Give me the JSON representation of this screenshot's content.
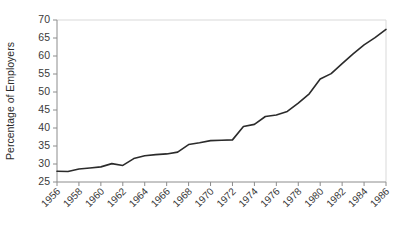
{
  "chart_data": {
    "type": "line",
    "title": "",
    "xlabel": "",
    "ylabel": "Percentage of Employers",
    "xlim": [
      1956,
      1986
    ],
    "ylim": [
      25,
      70
    ],
    "ytick_step": 5,
    "xtick_step": 2,
    "grid": false,
    "legend": "none",
    "yticks": [
      25,
      30,
      35,
      40,
      45,
      50,
      55,
      60,
      65,
      70
    ],
    "xticks": [
      1956,
      1958,
      1960,
      1962,
      1964,
      1966,
      1968,
      1970,
      1972,
      1974,
      1976,
      1978,
      1980,
      1982,
      1984,
      1986
    ],
    "x": [
      1956,
      1957,
      1958,
      1959,
      1960,
      1961,
      1962,
      1963,
      1964,
      1965,
      1966,
      1967,
      1968,
      1969,
      1970,
      1971,
      1972,
      1973,
      1974,
      1975,
      1976,
      1977,
      1978,
      1979,
      1980,
      1981,
      1982,
      1983,
      1984,
      1985,
      1986
    ],
    "values": [
      28.0,
      27.9,
      28.6,
      28.9,
      29.2,
      30.1,
      29.6,
      31.5,
      32.3,
      32.6,
      32.8,
      33.3,
      35.4,
      35.9,
      36.5,
      36.6,
      36.7,
      40.4,
      41.0,
      43.2,
      43.6,
      44.6,
      46.9,
      49.5,
      53.6,
      55.1,
      57.9,
      60.6,
      63.1,
      65.1,
      67.4
    ],
    "series_name": "Percentage of Employers",
    "line_color": "#2b2b2b",
    "axis_color": "#8c8c8c",
    "background_color": "#ffffff"
  },
  "layout": {
    "plot_left": 57,
    "plot_right": 386,
    "plot_top": 20,
    "plot_bottom": 182
  }
}
